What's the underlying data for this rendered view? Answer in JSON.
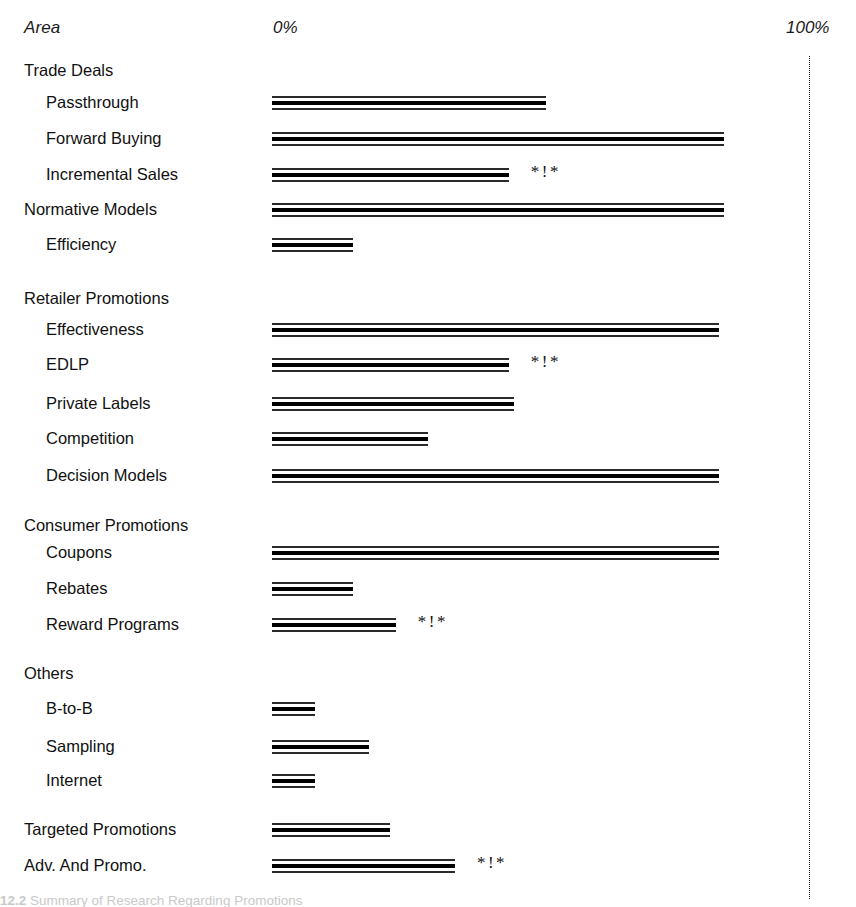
{
  "header": {
    "area_label": "Area",
    "zero_label": "0%",
    "hundred_label": "100%"
  },
  "markers": {
    "significance": "*!*"
  },
  "caption": {
    "number": "12.2",
    "text": "Summary of Research Regarding Promotions"
  },
  "chart_data": {
    "type": "bar",
    "orientation": "horizontal",
    "title": "",
    "xlabel": "",
    "ylabel": "Area",
    "xlim": [
      0,
      100
    ],
    "xticks": [
      0,
      100
    ],
    "xticklabels": [
      "0%",
      "100%"
    ],
    "grid": false,
    "legend": null,
    "annotation_symbol": "*!*",
    "annotation_meaning": "significance marker shown to the right of selected bars",
    "categories": [
      "Trade Deals",
      "Passthrough",
      "Forward Buying",
      "Incremental Sales",
      "Normative Models",
      "Efficiency",
      "Retailer Promotions",
      "Effectiveness",
      "EDLP",
      "Private Labels",
      "Competition",
      "Decision Models",
      "Consumer Promotions",
      "Coupons",
      "Rebates",
      "Reward Programs",
      "Others",
      "B-to-B",
      "Sampling",
      "Internet",
      "Targeted Promotions",
      "Adv. And Promo."
    ],
    "rows": [
      {
        "label": "Trade Deals",
        "level": "group",
        "value": null,
        "marker": false,
        "top": 60
      },
      {
        "label": "Passthrough",
        "level": "item",
        "value": 51,
        "marker": false,
        "top": 92
      },
      {
        "label": "Forward Buying",
        "level": "item",
        "value": 84,
        "marker": false,
        "top": 128
      },
      {
        "label": "Incremental Sales",
        "level": "item",
        "value": 44,
        "marker": true,
        "top": 164
      },
      {
        "label": "Normative Models",
        "level": "sub",
        "value": 84,
        "marker": false,
        "top": 199
      },
      {
        "label": "Efficiency",
        "level": "item",
        "value": 15,
        "marker": false,
        "top": 234
      },
      {
        "label": "Retailer Promotions",
        "level": "group",
        "value": null,
        "marker": false,
        "top": 288
      },
      {
        "label": "Effectiveness",
        "level": "item",
        "value": 83,
        "marker": false,
        "top": 319
      },
      {
        "label": "EDLP",
        "level": "item",
        "value": 44,
        "marker": true,
        "top": 354
      },
      {
        "label": "Private Labels",
        "level": "item",
        "value": 45,
        "marker": false,
        "top": 393
      },
      {
        "label": "Competition",
        "level": "item",
        "value": 29,
        "marker": false,
        "top": 428
      },
      {
        "label": "Decision Models",
        "level": "item",
        "value": 83,
        "marker": false,
        "top": 465
      },
      {
        "label": "Consumer Promotions",
        "level": "group",
        "value": null,
        "marker": false,
        "top": 515
      },
      {
        "label": "Coupons",
        "level": "item",
        "value": 83,
        "marker": false,
        "top": 542
      },
      {
        "label": "Rebates",
        "level": "item",
        "value": 15,
        "marker": false,
        "top": 578
      },
      {
        "label": "Reward Programs",
        "level": "item",
        "value": 23,
        "marker": true,
        "top": 614
      },
      {
        "label": "Others",
        "level": "group",
        "value": null,
        "marker": false,
        "top": 663
      },
      {
        "label": "B-to-B",
        "level": "item",
        "value": 8,
        "marker": false,
        "top": 698
      },
      {
        "label": "Sampling",
        "level": "item",
        "value": 18,
        "marker": false,
        "top": 736
      },
      {
        "label": "Internet",
        "level": "item",
        "value": 8,
        "marker": false,
        "top": 770
      },
      {
        "label": "Targeted Promotions",
        "level": "sub",
        "value": 22,
        "marker": false,
        "top": 819
      },
      {
        "label": "Adv. And Promo.",
        "level": "sub",
        "value": 34,
        "marker": true,
        "top": 855
      }
    ]
  }
}
